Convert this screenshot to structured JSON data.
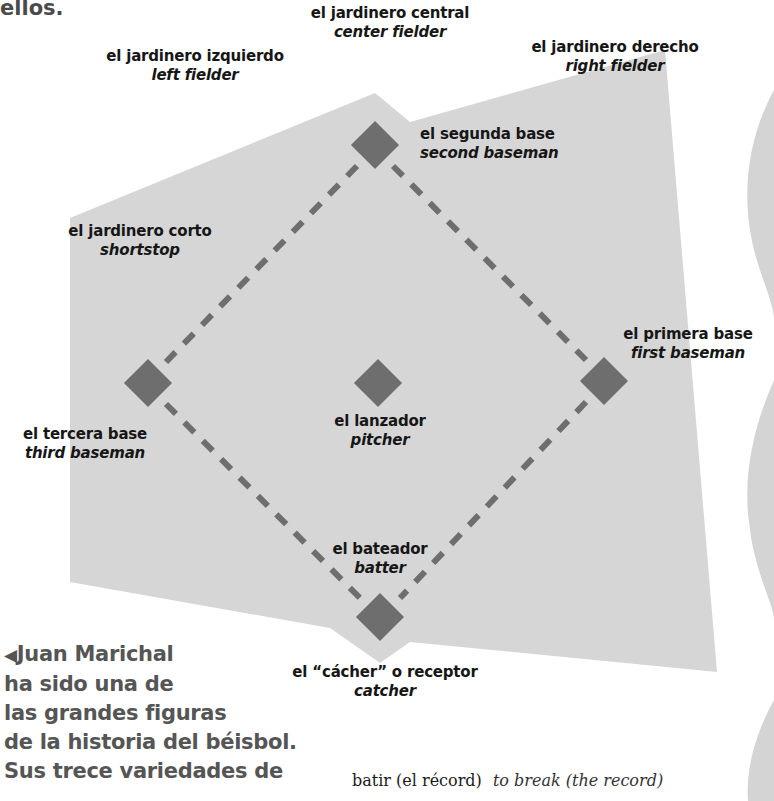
{
  "intro_fragment": "ellos.",
  "colors": {
    "field": "#d6d6d6",
    "bases": "#6e6e6e",
    "baselines": "#6e6e6e",
    "caption_text": "#555555",
    "label_text": "#161616"
  },
  "positions": [
    {
      "id": "center-fielder",
      "es": "el jardinero central",
      "en": "center fielder"
    },
    {
      "id": "left-fielder",
      "es": "el jardinero izquierdo",
      "en": "left fielder"
    },
    {
      "id": "right-fielder",
      "es": "el jardinero derecho",
      "en": "right fielder"
    },
    {
      "id": "second-baseman",
      "es": "el segunda base",
      "en": "second baseman"
    },
    {
      "id": "shortstop",
      "es": "el jardinero corto",
      "en": "shortstop"
    },
    {
      "id": "first-baseman",
      "es": "el primera base",
      "en": "first baseman"
    },
    {
      "id": "third-baseman",
      "es": "el tercera base",
      "en": "third baseman"
    },
    {
      "id": "pitcher",
      "es": "el lanzador",
      "en": "pitcher"
    },
    {
      "id": "batter",
      "es": "el bateador",
      "en": "batter"
    },
    {
      "id": "catcher",
      "es": "el “cácher” o receptor",
      "en": "catcher"
    }
  ],
  "bases": [
    {
      "name": "second-base",
      "x": 375,
      "y": 145
    },
    {
      "name": "third-base",
      "x": 148,
      "y": 383
    },
    {
      "name": "pitcher-mound",
      "x": 378,
      "y": 383
    },
    {
      "name": "first-base",
      "x": 604,
      "y": 381
    },
    {
      "name": "home-plate",
      "x": 380,
      "y": 617
    }
  ],
  "caption": {
    "marker": "◀",
    "lines": [
      "Juan Marichal",
      "ha sido una de",
      "las grandes figuras",
      "de la historia del béisbol.",
      "Sus trece variedades de"
    ]
  },
  "glossary": {
    "term": "batir (el récord)",
    "translation": "to break (the record)"
  }
}
